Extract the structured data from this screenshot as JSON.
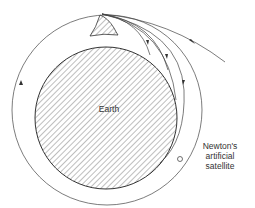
{
  "diagram": {
    "earth_label": "Earth",
    "satellite_label_lines": [
      "Newton's",
      "artificial",
      "satellite"
    ],
    "colors": {
      "line": "#333333",
      "background": "#ffffff"
    }
  }
}
